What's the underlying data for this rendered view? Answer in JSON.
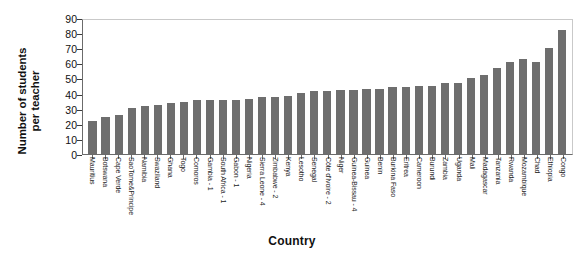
{
  "chart_data": {
    "type": "bar",
    "title": "",
    "xlabel": "Country",
    "ylabel": "Number of students per teacher",
    "ylabel_line1": "Number of students",
    "ylabel_line2": "per teacher",
    "ylim": [
      0,
      90
    ],
    "yticks": [
      90,
      80,
      70,
      60,
      50,
      40,
      30,
      20,
      10,
      0
    ],
    "grid": false,
    "legend": "none",
    "bar_color": "#6e6e6e",
    "categories": [
      "Mauritius",
      "Botswana",
      "Cape Verde",
      "SaoTome&Principe",
      "Namibia",
      "Swaziland",
      "Ghana",
      "Togo",
      "Comoros",
      "Gambia - 1",
      "South Africa - 1",
      "Gabon - 1",
      "Nigeria",
      "Sierra Leone - 4",
      "Zimbabwe - 2",
      "Kenya",
      "Lesotho",
      "Senegal",
      "Côte d'Ivoire - 2",
      "Niger",
      "Guinea-Bissau - 4",
      "Guinea",
      "Benin",
      "Burkina Faso",
      "Eritrea",
      "Cameroon",
      "Burundi",
      "Zambia",
      "Uganda",
      "Mali",
      "Madagascar",
      "Tanzania",
      "Rwanda",
      "Mozambique",
      "Chad",
      "Ethiopia",
      "Congo"
    ],
    "values": [
      22,
      25,
      26,
      31,
      32,
      33,
      34,
      35,
      36,
      36,
      36,
      36,
      37,
      38,
      38,
      39,
      41,
      42,
      42,
      43,
      43,
      44,
      44,
      45,
      45,
      46,
      46,
      48,
      48,
      51,
      53,
      58,
      62,
      64,
      62,
      71,
      83
    ]
  }
}
